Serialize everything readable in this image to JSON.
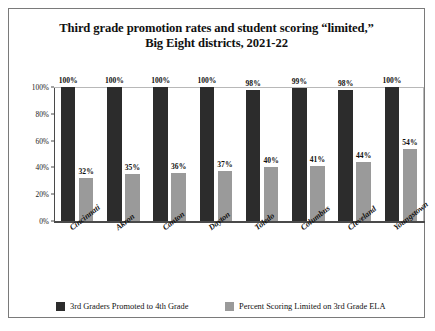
{
  "chart_data": {
    "type": "bar",
    "title": "Third grade promotion rates and student scoring “limited,” Big Eight districts, 2021-22",
    "title_line1": "Third grade promotion rates and student scoring “limited,”",
    "title_line2": "Big Eight districts, 2021-22",
    "xlabel": "",
    "ylabel": "",
    "ylim": [
      0,
      100
    ],
    "grid": false,
    "legend_position": "bottom",
    "categories": [
      "Cincinnati",
      "Akron",
      "Canton",
      "Dayton",
      "Toledo",
      "Columbus",
      "Cleveland",
      "Youngstown"
    ],
    "ytick_labels": [
      "0%",
      "20%",
      "40%",
      "60%",
      "80%",
      "100%"
    ],
    "ytick_values": [
      0,
      20,
      40,
      60,
      80,
      100
    ],
    "series": [
      {
        "name": "3rd Graders Promoted to 4th Grade",
        "color": "#2c2c2c",
        "values": [
          100,
          100,
          100,
          100,
          98,
          99,
          98,
          100
        ],
        "labels": [
          "100%",
          "100%",
          "100%",
          "100%",
          "98%",
          "99%",
          "98%",
          "100%"
        ]
      },
      {
        "name": "Percent Scoring Limited on 3rd Grade ELA",
        "color": "#9a9a9a",
        "values": [
          32,
          35,
          36,
          37,
          40,
          41,
          44,
          54
        ],
        "labels": [
          "32%",
          "35%",
          "36%",
          "37%",
          "40%",
          "41%",
          "44%",
          "54%"
        ]
      }
    ]
  },
  "legend": {
    "items": [
      {
        "label": "3rd Graders Promoted to 4th Grade",
        "color": "#2c2c2c"
      },
      {
        "label": "Percent Scoring Limited on 3rd Grade ELA",
        "color": "#9a9a9a"
      }
    ]
  }
}
